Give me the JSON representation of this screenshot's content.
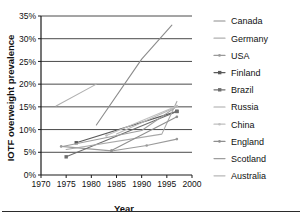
{
  "chart_data": {
    "type": "line",
    "title": "",
    "xlabel": "Year",
    "ylabel": "IOTF overweight prevalence",
    "xlim": [
      1970,
      2000
    ],
    "ylim": [
      0,
      35
    ],
    "grid": true,
    "legend_position": "right",
    "x_ticks": [
      "1970",
      "1975",
      "1980",
      "1985",
      "1990",
      "1995",
      "2000"
    ],
    "x_tick_values": [
      1970,
      1975,
      1980,
      1985,
      1990,
      1995,
      2000
    ],
    "y_ticks": [
      "0%",
      "5%",
      "10%",
      "15%",
      "20%",
      "25%",
      "30%",
      "35%"
    ],
    "y_tick_values": [
      0,
      5,
      10,
      15,
      20,
      25,
      30,
      35
    ],
    "series": [
      {
        "name": "Canada",
        "color": "#8c8c8c",
        "marker": "none",
        "points": [
          [
            1981,
            11.0
          ],
          [
            1990,
            25.5
          ],
          [
            1996,
            33.0
          ]
        ]
      },
      {
        "name": "Germany",
        "color": "#b0b0b0",
        "marker": "none",
        "points": [
          [
            1973,
            15.2
          ],
          [
            1981,
            20.0
          ]
        ]
      },
      {
        "name": "USA",
        "color": "#9a9a9a",
        "marker": "dot",
        "points": [
          [
            1974,
            6.3
          ],
          [
            1984,
            5.3
          ],
          [
            1991,
            6.5
          ],
          [
            1997,
            7.9
          ]
        ]
      },
      {
        "name": "Finland",
        "color": "#5a5a5a",
        "marker": "square",
        "points": [
          [
            1977,
            7.1
          ],
          [
            1997,
            14.0
          ]
        ]
      },
      {
        "name": "Brazil",
        "color": "#6e6e6e",
        "marker": "square",
        "points": [
          [
            1975,
            4.0
          ],
          [
            1997,
            14.0
          ]
        ]
      },
      {
        "name": "Russia",
        "color": "#a8a8a8",
        "marker": "none",
        "points": [
          [
            1975,
            5.6
          ],
          [
            1994,
            9.0
          ],
          [
            1997,
            16.2
          ]
        ]
      },
      {
        "name": "China",
        "color": "#c0c0c0",
        "marker": "dot",
        "points": [
          [
            1983,
            8.7
          ],
          [
            1997,
            15.2
          ]
        ]
      },
      {
        "name": "England",
        "color": "#8f8f8f",
        "marker": "dot",
        "points": [
          [
            1984,
            5.4
          ],
          [
            1997,
            12.8
          ]
        ]
      },
      {
        "name": "Scotland",
        "color": "#9e9e9e",
        "marker": "none",
        "points": [
          [
            1974,
            6.2
          ],
          [
            1990,
            9.8
          ],
          [
            1997,
            15.1
          ]
        ]
      },
      {
        "name": "Australia",
        "color": "#b8b8b8",
        "marker": "none",
        "points": [
          [
            1985,
            9.0
          ],
          [
            1997,
            15.0
          ]
        ]
      }
    ]
  },
  "legend": {
    "entries": [
      "Canada",
      "Germany",
      "USA",
      "Finland",
      "Brazil",
      "Russia",
      "China",
      "England",
      "Scotland",
      "Australia"
    ]
  }
}
